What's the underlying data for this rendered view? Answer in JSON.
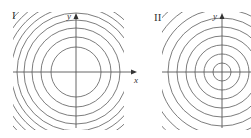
{
  "figure": {
    "width": 251,
    "height": 138,
    "colors": {
      "ring": "#6e6e6e",
      "axis": "#555555",
      "text": "#333333",
      "background": "#ffffff"
    },
    "panels": [
      {
        "id": "I",
        "label": "I",
        "label_pos": [
          12,
          19
        ],
        "center": [
          76,
          72
        ],
        "clip": {
          "x": 13,
          "y": 12,
          "w": 111,
          "h": 118
        },
        "x_axis": {
          "from": 13,
          "to": 137,
          "label": "x",
          "label_pos": [
            134,
            83
          ],
          "arrow": true
        },
        "y_axis": {
          "from": 128,
          "to": 13,
          "label": "y",
          "label_pos": [
            67,
            19
          ],
          "arrow": true
        },
        "ring_radii": [
          25,
          35,
          44,
          52,
          59,
          65,
          71,
          77,
          83,
          89
        ],
        "spacing": "decreasing"
      },
      {
        "id": "II",
        "label": "II",
        "label_pos": [
          154,
          21
        ],
        "center": [
          222,
          72
        ],
        "clip": {
          "x": 162,
          "y": 12,
          "w": 89,
          "h": 118
        },
        "x_axis": {
          "from": 162,
          "to": 251,
          "label": "",
          "arrow": false
        },
        "y_axis": {
          "from": 128,
          "to": 13,
          "label": "y",
          "label_pos": [
            213,
            19
          ],
          "arrow": true
        },
        "ring_radii": [
          9,
          18,
          27,
          36,
          45,
          54,
          63,
          72,
          81
        ],
        "spacing": "uniform"
      }
    ]
  },
  "text": {
    "panel_I_label": "I",
    "panel_II_label": "II",
    "panel_I_x_label": "x",
    "panel_I_y_label": "y",
    "panel_II_y_label": "y"
  }
}
